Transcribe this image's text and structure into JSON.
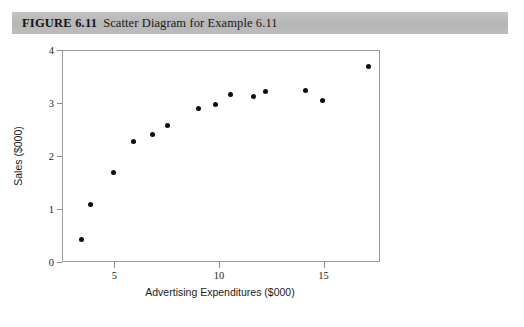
{
  "caption": {
    "label": "FIGURE 6.11",
    "text": "Scatter Diagram for Example 6.11"
  },
  "chart_data": {
    "type": "scatter",
    "title": "Scatter Diagram for Example 6.11",
    "xlabel": "Advertising Expenditures ($000)",
    "ylabel": "Sales ($000)",
    "xlim": [
      2.5,
      17.7
    ],
    "ylim": [
      0,
      4
    ],
    "xticks": [
      5,
      10,
      15
    ],
    "yticks": [
      0,
      1,
      2,
      3,
      4
    ],
    "xtick_labels": [
      "5",
      "10",
      "15"
    ],
    "ytick_labels": [
      "0",
      "1",
      "2",
      "3",
      "4"
    ],
    "grid": false,
    "legend": null,
    "marker": "filled-circle",
    "marker_color": "#0d0d0d",
    "points": [
      {
        "x": 3.4,
        "y": 0.44
      },
      {
        "x": 3.8,
        "y": 1.11
      },
      {
        "x": 4.9,
        "y": 1.71
      },
      {
        "x": 5.85,
        "y": 2.29
      },
      {
        "x": 6.8,
        "y": 2.43
      },
      {
        "x": 7.5,
        "y": 2.6
      },
      {
        "x": 9.0,
        "y": 2.92
      },
      {
        "x": 9.8,
        "y": 3.0
      },
      {
        "x": 10.5,
        "y": 3.17
      },
      {
        "x": 11.6,
        "y": 3.15
      },
      {
        "x": 12.2,
        "y": 3.23
      },
      {
        "x": 14.1,
        "y": 3.25
      },
      {
        "x": 14.9,
        "y": 3.07
      },
      {
        "x": 17.1,
        "y": 3.7
      }
    ]
  },
  "axis_colors": {
    "frame": "#9a9a9a",
    "caption_bar": "#b9b9b9"
  }
}
